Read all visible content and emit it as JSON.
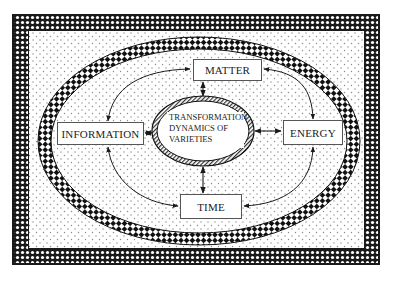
{
  "diagram": {
    "nodes": {
      "matter": "MATTER",
      "information": "INFORMATION",
      "energy": "ENERGY",
      "time": "TIME",
      "center": {
        "line1": "TRANSFORMATION",
        "line2": "DYNAMICS OF",
        "line3": "VARIETIES"
      }
    },
    "edges": [
      {
        "from": "center",
        "to": "matter",
        "style": "double-arrow"
      },
      {
        "from": "center",
        "to": "information",
        "style": "double-arrow"
      },
      {
        "from": "center",
        "to": "energy",
        "style": "double-arrow"
      },
      {
        "from": "center",
        "to": "time",
        "style": "double-arrow"
      },
      {
        "from": "matter",
        "to": "information",
        "style": "curved-double-arrow"
      },
      {
        "from": "matter",
        "to": "energy",
        "style": "curved-double-arrow"
      },
      {
        "from": "information",
        "to": "time",
        "style": "curved-double-arrow"
      },
      {
        "from": "energy",
        "to": "time",
        "style": "curved-double-arrow"
      }
    ],
    "colors": {
      "ink": "#1a1a1a",
      "background_dots": "#9a9a9a",
      "box_fill": "#ffffff"
    }
  }
}
